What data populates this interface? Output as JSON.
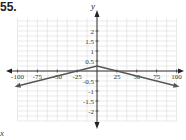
{
  "problem_number": "55.",
  "corner_label": "x",
  "chart_data": {
    "type": "line",
    "title": "",
    "xlabel": "x",
    "ylabel": "y",
    "xlim": [
      -100,
      100
    ],
    "ylim": [
      -2.5,
      2.5
    ],
    "grid": true,
    "x_ticks": [
      -100,
      -75,
      -50,
      -25,
      25,
      50,
      75,
      100
    ],
    "x_tick_labels": [
      "-100",
      "-75",
      "-50",
      "-25",
      "25",
      "50",
      "75",
      "100"
    ],
    "y_ticks": [
      2,
      1.5,
      1,
      0.5,
      -0.5,
      -1,
      -1.5,
      -2
    ],
    "y_tick_labels": [
      "2",
      "1.5",
      "1",
      "0.5",
      "-0.5",
      "-1",
      "-1.5",
      "-2"
    ],
    "series": [
      {
        "name": "y = -0.01|x| + 0.25",
        "x": [
          -100,
          -25,
          0,
          25,
          100
        ],
        "y": [
          -0.75,
          0,
          0.25,
          0,
          -0.75
        ],
        "color": "#555555",
        "arrows_at_ends": true
      }
    ]
  }
}
